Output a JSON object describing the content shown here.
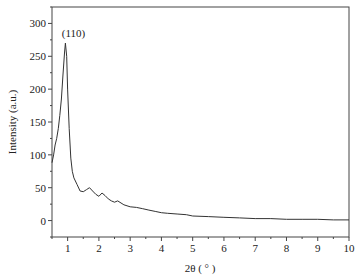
{
  "chart_data": {
    "type": "line",
    "title": "",
    "xlabel": "2θ ( ° )",
    "ylabel": "Intensity (a.u.)",
    "xlim": [
      0.5,
      10
    ],
    "ylim": [
      -25,
      325
    ],
    "x_ticks": [
      1,
      2,
      3,
      4,
      5,
      6,
      7,
      8,
      9,
      10
    ],
    "y_ticks": [
      0,
      50,
      100,
      150,
      200,
      250,
      300
    ],
    "grid": false,
    "legend": null,
    "annotations": [
      {
        "text": "(110)",
        "x": 0.93,
        "y": 270
      }
    ],
    "series": [
      {
        "name": "XRD pattern",
        "x": [
          0.5,
          0.55,
          0.6,
          0.65,
          0.7,
          0.75,
          0.8,
          0.85,
          0.9,
          0.93,
          0.97,
          1.0,
          1.05,
          1.1,
          1.15,
          1.2,
          1.3,
          1.4,
          1.5,
          1.6,
          1.7,
          1.8,
          1.9,
          2.0,
          2.1,
          2.2,
          2.3,
          2.4,
          2.5,
          2.6,
          2.8,
          3.0,
          3.2,
          3.4,
          3.6,
          3.8,
          4.0,
          4.2,
          4.5,
          4.8,
          5.0,
          5.5,
          6.0,
          6.5,
          7.0,
          7.5,
          8.0,
          8.5,
          9.0,
          9.5,
          10.0
        ],
        "y": [
          88,
          100,
          115,
          125,
          140,
          160,
          185,
          220,
          255,
          270,
          250,
          200,
          140,
          95,
          75,
          65,
          55,
          45,
          44,
          47,
          50,
          45,
          40,
          37,
          42,
          38,
          33,
          30,
          28,
          30,
          24,
          21,
          20,
          18,
          16,
          14,
          12,
          11,
          10,
          9,
          7,
          6,
          5,
          4,
          3,
          3,
          2,
          2,
          2,
          1,
          1
        ]
      }
    ]
  }
}
